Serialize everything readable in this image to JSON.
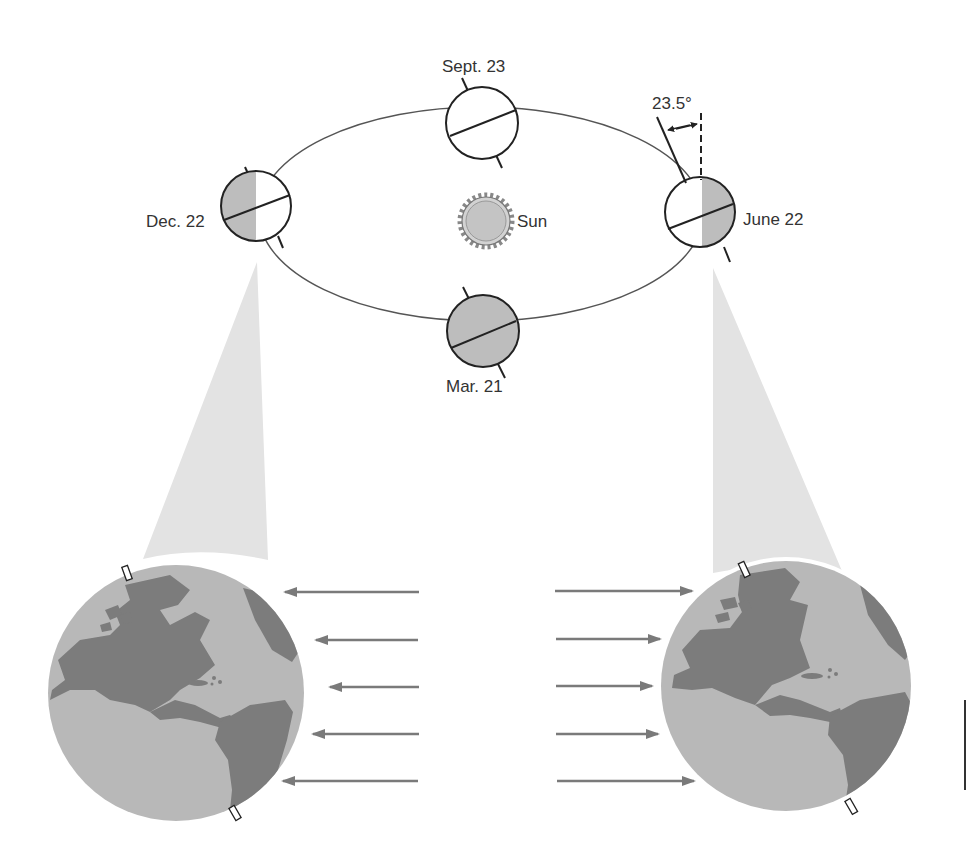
{
  "diagram": {
    "sun": {
      "label": "Sun",
      "color": "#c4c4c4"
    },
    "orbit_positions": [
      {
        "id": "sept",
        "label": "Sept. 23",
        "shading": "none"
      },
      {
        "id": "dec",
        "label": "Dec. 22",
        "shading": "left-half"
      },
      {
        "id": "june",
        "label": "June 22",
        "shading": "right-half"
      },
      {
        "id": "mar",
        "label": "Mar. 21",
        "shading": "full"
      }
    ],
    "tilt_annotation": {
      "label": "23.5°"
    },
    "globes": [
      {
        "id": "dec-globe",
        "side": "left",
        "arrow_direction": "left",
        "arrow_count": 5
      },
      {
        "id": "june-globe",
        "side": "right",
        "arrow_direction": "right",
        "arrow_count": 5
      }
    ],
    "colors": {
      "line": "#222222",
      "shade": "#bdbdbd",
      "ocean": "#b8b8b8",
      "land": "#7c7c7c",
      "cone": "#e3e3e3",
      "arrow": "#7a7a7a",
      "text": "#333333"
    }
  }
}
